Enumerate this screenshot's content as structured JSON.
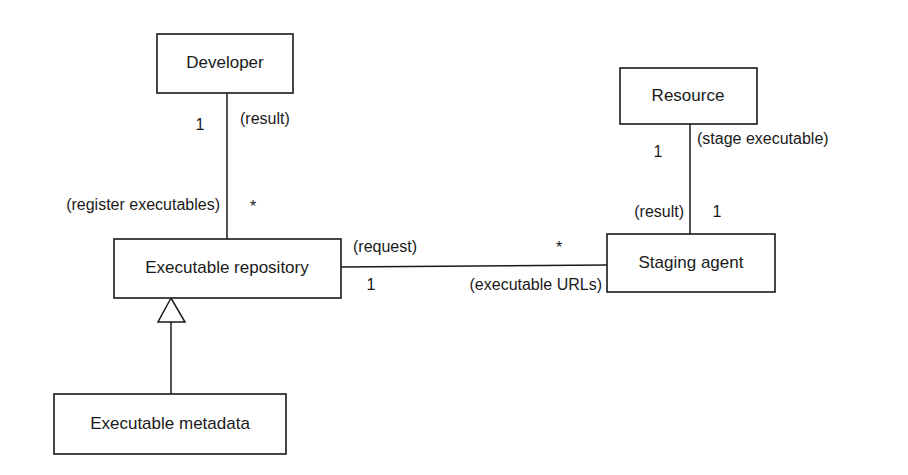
{
  "diagram": {
    "type": "UML class diagram",
    "classes": {
      "developer": "Developer",
      "executable_repository": "Executable repository",
      "executable_metadata": "Executable metadata",
      "resource": "Resource",
      "staging_agent": "Staging agent"
    },
    "associations": [
      {
        "from": "Developer",
        "to": "Executable repository",
        "labels": {
          "developer_end_multiplicity": "1",
          "developer_end_role": "(result)",
          "repository_end_role": "(register executables)",
          "repository_end_multiplicity": "*"
        }
      },
      {
        "from": "Executable repository",
        "to": "Staging agent",
        "labels": {
          "repository_end_role": "(request)",
          "repository_end_multiplicity": "1",
          "agent_end_multiplicity": "*",
          "agent_end_role": "(executable URLs)"
        }
      },
      {
        "from": "Resource",
        "to": "Staging agent",
        "labels": {
          "resource_end_multiplicity": "1",
          "resource_end_role": "(stage executable)",
          "agent_end_role": "(result)",
          "agent_end_multiplicity": "1"
        }
      }
    ],
    "generalizations": [
      {
        "child": "Executable metadata",
        "parent": "Executable repository"
      }
    ]
  }
}
